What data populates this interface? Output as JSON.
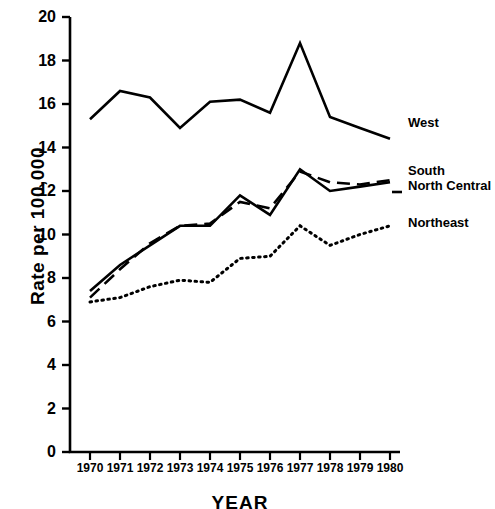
{
  "chart_data": {
    "type": "line",
    "title": "",
    "xlabel": "YEAR",
    "ylabel": "Rate per 100,000",
    "x": [
      1970,
      1971,
      1972,
      1973,
      1974,
      1975,
      1976,
      1977,
      1978,
      1979,
      1980
    ],
    "categories": [
      "1970",
      "1971",
      "1972",
      "1973",
      "1974",
      "1975",
      "1976",
      "1977",
      "1978",
      "1979",
      "1980"
    ],
    "xlim": [
      1970,
      1980
    ],
    "ylim": [
      0,
      20
    ],
    "yticks": [
      0,
      2,
      4,
      6,
      8,
      10,
      12,
      14,
      16,
      18,
      20
    ],
    "ytick_labels": [
      "0",
      "2",
      "4",
      "6",
      "8",
      "10",
      "12",
      "14",
      "16",
      "18",
      "20"
    ],
    "grid": false,
    "legend_position": "right-inline",
    "series": [
      {
        "name": "West",
        "style": "solid",
        "values": [
          15.3,
          16.6,
          16.3,
          14.9,
          16.1,
          16.2,
          15.6,
          18.8,
          15.4,
          14.9,
          14.4
        ]
      },
      {
        "name": "South",
        "style": "solid",
        "values": [
          7.4,
          8.6,
          9.5,
          10.4,
          10.4,
          11.8,
          10.9,
          13.0,
          12.0,
          12.2,
          12.4
        ]
      },
      {
        "name": "North Central",
        "style": "dashed",
        "values": [
          7.1,
          8.4,
          9.6,
          10.4,
          10.5,
          11.5,
          11.2,
          12.9,
          12.4,
          12.3,
          12.5
        ]
      },
      {
        "name": "Northeast",
        "style": "dotted",
        "values": [
          6.9,
          7.1,
          7.6,
          7.9,
          7.8,
          8.9,
          9.0,
          10.4,
          9.5,
          10.0,
          10.4
        ]
      }
    ]
  },
  "legend": {
    "items": [
      {
        "label": "West",
        "style": "solid"
      },
      {
        "label": "South",
        "style": "solid"
      },
      {
        "label": "North Central",
        "style": "dashed"
      },
      {
        "label": "Northeast",
        "style": "dotted"
      }
    ]
  }
}
